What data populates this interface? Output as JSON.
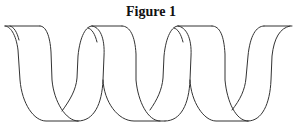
{
  "figure": {
    "title": "Figure 1",
    "stroke_color": "#333333",
    "background_color": "#ffffff"
  }
}
